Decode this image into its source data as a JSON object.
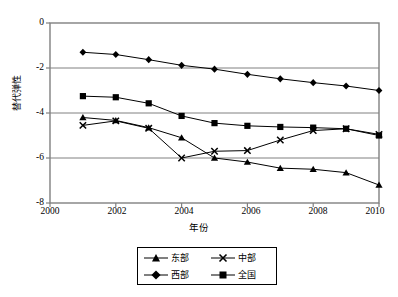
{
  "chart_data": {
    "type": "line",
    "title": "",
    "xlabel": "年份",
    "ylabel": "替代弹性",
    "xlim": [
      2000,
      2010
    ],
    "ylim": [
      -8,
      0
    ],
    "xticks": [
      "2000",
      "2002",
      "2004",
      "2006",
      "2008",
      "2010"
    ],
    "yticks": [
      "0",
      "-2",
      "-4",
      "-6",
      "-8"
    ],
    "grid": "horizontal",
    "legend_position": "below",
    "x": [
      2001,
      2002,
      2003,
      2004,
      2005,
      2006,
      2007,
      2008,
      2009,
      2010
    ],
    "series": [
      {
        "name": "东部",
        "marker": "triangle",
        "values": [
          -4.2,
          -4.33,
          -4.65,
          -5.1,
          -6.0,
          -6.18,
          -6.45,
          -6.5,
          -6.65,
          -7.2
        ]
      },
      {
        "name": "中部",
        "marker": "x",
        "values": [
          -4.55,
          -4.35,
          -4.68,
          -6.0,
          -5.7,
          -5.67,
          -5.2,
          -4.78,
          -4.7,
          -4.95
        ]
      },
      {
        "name": "西部",
        "marker": "diamond",
        "values": [
          -1.3,
          -1.4,
          -1.63,
          -1.88,
          -2.05,
          -2.28,
          -2.48,
          -2.65,
          -2.8,
          -3.0
        ]
      },
      {
        "name": "全国",
        "marker": "square",
        "values": [
          -3.25,
          -3.3,
          -3.57,
          -4.13,
          -4.45,
          -4.57,
          -4.62,
          -4.65,
          -4.7,
          -5.0
        ]
      }
    ]
  },
  "legend": {
    "items": [
      {
        "label": "东部",
        "marker": "triangle"
      },
      {
        "label": "中部",
        "marker": "x"
      },
      {
        "label": "西部",
        "marker": "diamond"
      },
      {
        "label": "全国",
        "marker": "square"
      }
    ]
  },
  "colors": {
    "line": "#000000",
    "grid": "#808080",
    "axis": "#808080",
    "background": "#ffffff"
  }
}
